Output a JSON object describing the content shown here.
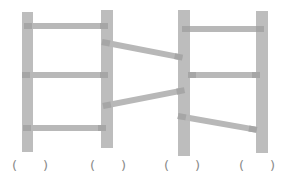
{
  "figure": {
    "color_post": "#bdbdbd",
    "color_rung": "#b8b8b8",
    "answer_slots": [
      {
        "open": "(",
        "close": ")"
      },
      {
        "open": "(",
        "close": ")"
      },
      {
        "open": "(",
        "close": ")"
      },
      {
        "open": "(",
        "close": ")"
      }
    ]
  }
}
